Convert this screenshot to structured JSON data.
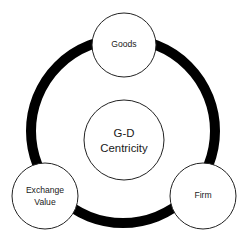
{
  "diagram": {
    "title": "G-D Centricity",
    "type": "concentric-node-ring",
    "background_color": "#ffffff",
    "ring": {
      "name": "outer-ring",
      "color": "#000000",
      "center_x": 123,
      "center_y": 131,
      "radius": 92,
      "thickness": 10
    },
    "core": {
      "label_line_1": "G-D",
      "label_line_2": "Centricity",
      "center_x": 124,
      "center_y": 140,
      "radius": 40,
      "fill_color": "#ffffff",
      "stroke_color": "#222222"
    },
    "nodes": [
      {
        "id": "goods",
        "label_line_1": "Goods",
        "label_line_2": "",
        "center_x": 124,
        "center_y": 45,
        "radius": 32,
        "fill_color": "#ffffff",
        "stroke_color": "#222222"
      },
      {
        "id": "exchange-value",
        "label_line_1": "Exchange",
        "label_line_2": "Value",
        "center_x": 45,
        "center_y": 196,
        "radius": 33,
        "fill_color": "#ffffff",
        "stroke_color": "#222222"
      },
      {
        "id": "firm",
        "label_line_1": "Firm",
        "label_line_2": "",
        "center_x": 203,
        "center_y": 196,
        "radius": 33,
        "fill_color": "#ffffff",
        "stroke_color": "#222222"
      }
    ]
  }
}
